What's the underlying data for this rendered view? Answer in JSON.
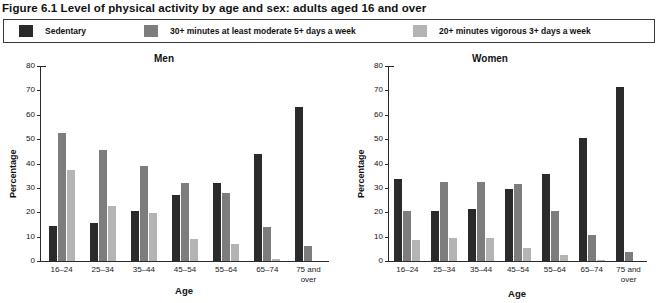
{
  "figure": {
    "title": "Figure 6.1 Level of physical activity by age and sex: adults aged 16 and over"
  },
  "legend": {
    "items": [
      {
        "label": "Sedentary",
        "color": "#2b2b2b"
      },
      {
        "label": "30+ minutes at least moderate 5+ days a week",
        "color": "#7d7d7d"
      },
      {
        "label": "20+ minutes vigorous 3+ days a week",
        "color": "#b4b4b4"
      }
    ]
  },
  "axis": {
    "ylabel": "Percentage",
    "xlabel": "Age",
    "yticks": [
      0,
      10,
      20,
      30,
      40,
      50,
      60,
      70,
      80
    ],
    "ylim": [
      0,
      80
    ],
    "categories_line1": [
      "16–24",
      "25–34",
      "35–44",
      "45–54",
      "55–64",
      "65–74",
      "75 and"
    ],
    "categories_line2": [
      "",
      "",
      "",
      "",
      "",
      "",
      "over"
    ]
  },
  "chart_data": [
    {
      "type": "bar",
      "title": "Men",
      "xlabel": "Age",
      "ylabel": "Percentage",
      "ylim": [
        0,
        80
      ],
      "yticks": [
        0,
        10,
        20,
        30,
        40,
        50,
        60,
        70,
        80
      ],
      "grid": false,
      "legend_position": "top",
      "categories": [
        "16–24",
        "25–34",
        "35–44",
        "45–54",
        "55–64",
        "65–74",
        "75 and over"
      ],
      "series": [
        {
          "name": "Sedentary",
          "color": "#2b2b2b",
          "values": [
            14.5,
            15.5,
            20.5,
            27,
            32,
            44,
            63
          ]
        },
        {
          "name": "30+ minutes at least moderate 5+ days a week",
          "color": "#7d7d7d",
          "values": [
            52.5,
            45.5,
            39,
            32,
            28,
            14,
            6
          ]
        },
        {
          "name": "20+ minutes vigorous 3+ days a week",
          "color": "#b4b4b4",
          "values": [
            37.5,
            22.5,
            19.5,
            9,
            7,
            1,
            0
          ]
        }
      ]
    },
    {
      "type": "bar",
      "title": "Women",
      "xlabel": "Age",
      "ylabel": "Percentage",
      "ylim": [
        0,
        80
      ],
      "yticks": [
        0,
        10,
        20,
        30,
        40,
        50,
        60,
        70,
        80
      ],
      "grid": false,
      "legend_position": "top",
      "categories": [
        "16–24",
        "25–34",
        "35–44",
        "45–54",
        "55–64",
        "65–74",
        "75 and over"
      ],
      "series": [
        {
          "name": "Sedentary",
          "color": "#2b2b2b",
          "values": [
            33.5,
            20.5,
            21.5,
            29.5,
            35.5,
            50.5,
            71.5
          ]
        },
        {
          "name": "30+ minutes at least moderate 5+ days a week",
          "color": "#7d7d7d",
          "values": [
            20.5,
            32.5,
            32.5,
            31.5,
            20.5,
            10.5,
            3.5
          ]
        },
        {
          "name": "20+ minutes vigorous 3+ days a week",
          "color": "#b4b4b4",
          "values": [
            8.5,
            9.5,
            9.5,
            5.5,
            2.5,
            0.4,
            0
          ]
        }
      ]
    }
  ]
}
